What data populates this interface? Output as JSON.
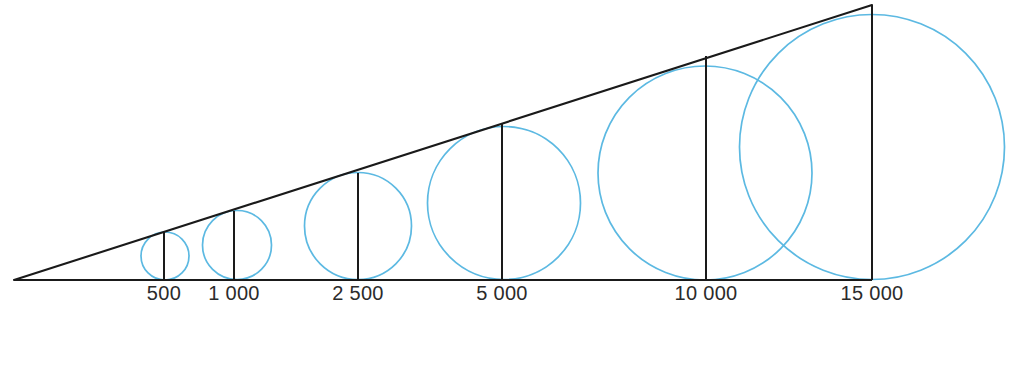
{
  "figure": {
    "title": "",
    "background_color": "#ffffff",
    "line_color": "#1a1a1a",
    "circle_color": "#5cb9e2",
    "label_color": "#2b2b2b",
    "width": 1010,
    "height": 365
  },
  "chart_data": {
    "type": "bar",
    "title": "",
    "xlabel": "",
    "ylabel": "",
    "grid": false,
    "legend": null,
    "categories": [
      "500",
      "1 000",
      "2 500",
      "5 000",
      "10 000",
      "15 000"
    ],
    "values": [
      500,
      1000,
      2500,
      5000,
      10000,
      15000
    ],
    "value_labels": [
      "500",
      "1 000",
      "2 500",
      "5 000",
      "10 000",
      "15 000"
    ],
    "ylim": [
      0,
      15000
    ],
    "baseline": {
      "y": 280,
      "x_start": 14,
      "x_end": 872
    },
    "apex": {
      "x": 14,
      "y": 280
    },
    "hypotenuse": {
      "x1": 14,
      "y1": 280,
      "x2": 872,
      "y2": 5
    },
    "bars": [
      {
        "label": "500",
        "value": 500,
        "x": 164,
        "top_y": 232,
        "height": 48,
        "circle_diameter": 48,
        "circle_center_x": 165,
        "circle_center_y": 256
      },
      {
        "label": "1 000",
        "value": 1000,
        "x": 234,
        "top_y": 211,
        "height": 69,
        "circle_diameter": 69,
        "circle_center_x": 237,
        "circle_center_y": 245
      },
      {
        "label": "2 500",
        "value": 2500,
        "x": 358,
        "top_y": 173,
        "height": 107,
        "circle_diameter": 107,
        "circle_center_x": 358,
        "circle_center_y": 226
      },
      {
        "label": "5 000",
        "value": 5000,
        "x": 502,
        "top_y": 123,
        "height": 157,
        "circle_diameter": 153,
        "circle_center_x": 504,
        "circle_center_y": 203
      },
      {
        "label": "10 000",
        "value": 10000,
        "x": 706,
        "top_y": 56,
        "height": 224,
        "circle_diameter": 214,
        "circle_center_x": 705,
        "circle_center_y": 173
      },
      {
        "label": "15 000",
        "value": 15000,
        "x": 872,
        "top_y": 5,
        "height": 275,
        "circle_diameter": 265,
        "circle_center_x": 872,
        "circle_center_y": 147
      }
    ],
    "label_row_y": 300
  }
}
